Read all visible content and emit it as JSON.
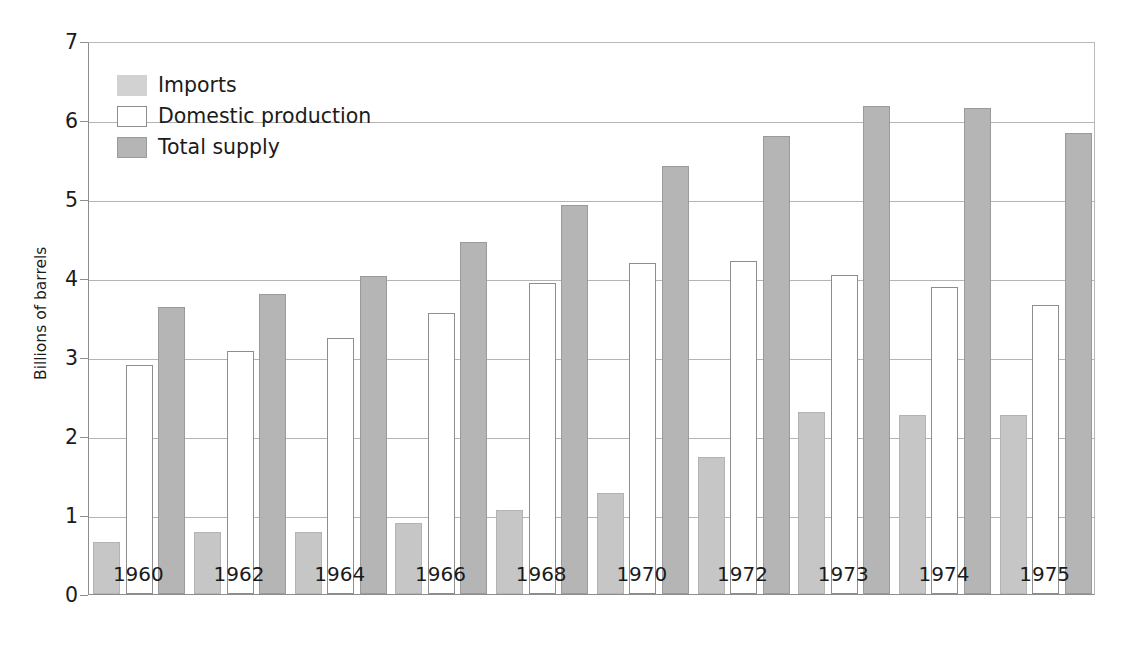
{
  "chart_data": {
    "type": "bar",
    "title": "",
    "xlabel": "",
    "ylabel": "Billions of barrels",
    "ylim": [
      0,
      7
    ],
    "ytick_labels": [
      "0",
      "1",
      "2",
      "3",
      "4",
      "5",
      "6",
      "7"
    ],
    "yticks": [
      0,
      1,
      2,
      3,
      4,
      5,
      6,
      7
    ],
    "grid": true,
    "legend_position": "upper-left",
    "categories": [
      "1960",
      "1962",
      "1964",
      "1966",
      "1968",
      "1970",
      "1972",
      "1973",
      "1974",
      "1975"
    ],
    "series": [
      {
        "name": "Imports",
        "color": "#c6c6c6",
        "values": [
          0.66,
          0.78,
          0.79,
          0.9,
          1.06,
          1.28,
          1.74,
          2.31,
          2.26,
          2.26
        ]
      },
      {
        "name": "Domestic production",
        "color": "#ffffff",
        "values": [
          2.9,
          3.07,
          3.24,
          3.56,
          3.94,
          4.19,
          4.21,
          4.04,
          3.88,
          3.66
        ]
      },
      {
        "name": "Total supply",
        "color": "#b5b5b5",
        "values": [
          3.63,
          3.8,
          4.03,
          4.45,
          4.93,
          5.42,
          5.8,
          6.18,
          6.15,
          5.83
        ]
      }
    ]
  },
  "legend": {
    "items": [
      {
        "label": "Imports",
        "swatch": "imports"
      },
      {
        "label": "Domestic production",
        "swatch": "domestic"
      },
      {
        "label": "Total supply",
        "swatch": "total"
      }
    ]
  },
  "axis": {
    "y_title": "Billions of barrels"
  },
  "colors": {
    "imports": "#c6c6c6",
    "domestic": "#ffffff",
    "total": "#b5b5b5",
    "axis": "#8d8d8d",
    "grid": "#b4b4b4",
    "text": "#1b1b1b"
  }
}
